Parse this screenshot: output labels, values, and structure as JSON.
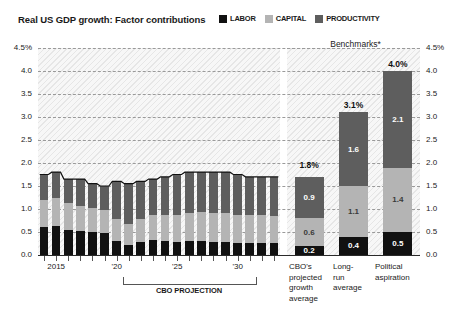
{
  "header": {
    "title": "Real US GDP growth: Factor contributions"
  },
  "legend": {
    "position": "top-right",
    "items": [
      {
        "label": "LABOR",
        "color": "#111111",
        "icon": "square-swatch-icon"
      },
      {
        "label": "CAPITAL",
        "color": "#b4b4b4",
        "icon": "square-swatch-icon"
      },
      {
        "label": "PRODUCTIVITY",
        "color": "#5e5e5e",
        "icon": "square-swatch-icon"
      }
    ]
  },
  "benchmarks_header": "Benchmarks*",
  "projection_bracket_label": "CBO PROJECTION",
  "axis": {
    "y_ticks": [
      "4.5%",
      "4.0",
      "3.5",
      "3.0",
      "2.5",
      "2.0",
      "1.5",
      "1.0",
      "0.5",
      "0.0"
    ],
    "y_ticks_right": [
      "4.5%",
      "4.0",
      "3.5",
      "3.0",
      "2.5",
      "2.0",
      "1.5",
      "1.0",
      "0.5",
      "0.0"
    ],
    "x_labels": [
      "2015",
      "'20",
      "'25",
      "'30"
    ]
  },
  "chart_data": {
    "type": "bar",
    "title": "Real US GDP growth: Factor contributions",
    "subtitle": "",
    "xlabel": "",
    "ylabel": "",
    "ylim": [
      0,
      4.5
    ],
    "grid": true,
    "stacked": true,
    "legend_position": "top-right",
    "annotations": [
      "Benchmarks*",
      "CBO PROJECTION"
    ],
    "series": [
      {
        "name": "LABOR",
        "color": "#111111",
        "values": [
          0.6,
          0.62,
          0.55,
          0.52,
          0.5,
          0.48,
          0.3,
          0.22,
          0.28,
          0.32,
          0.3,
          0.28,
          0.3,
          0.3,
          0.28,
          0.28,
          0.26,
          0.26,
          0.26,
          0.26
        ]
      },
      {
        "name": "CAPITAL",
        "color": "#b4b4b4",
        "values": [
          0.6,
          0.62,
          0.58,
          0.55,
          0.52,
          0.5,
          0.48,
          0.45,
          0.5,
          0.55,
          0.58,
          0.6,
          0.62,
          0.64,
          0.64,
          0.64,
          0.62,
          0.62,
          0.6,
          0.58
        ]
      },
      {
        "name": "PRODUCTIVITY",
        "color": "#5e5e5e",
        "values": [
          0.55,
          0.56,
          0.52,
          0.58,
          0.53,
          0.52,
          0.82,
          0.88,
          0.82,
          0.78,
          0.82,
          0.87,
          0.88,
          0.86,
          0.88,
          0.88,
          0.87,
          0.82,
          0.84,
          0.86
        ]
      }
    ],
    "x": [
      2014,
      2015,
      2016,
      2017,
      2018,
      2019,
      2020,
      2021,
      2022,
      2023,
      2024,
      2025,
      2026,
      2027,
      2028,
      2029,
      2030,
      2031,
      2032,
      2033
    ],
    "projection_starts_at": 2023,
    "benchmarks": [
      {
        "label_lines": [
          "CBO's",
          "projected",
          "growth",
          "average"
        ],
        "total": "1.8%",
        "total_value": 1.8,
        "segments": [
          {
            "name": "LABOR",
            "label": "0.2",
            "value": 0.2
          },
          {
            "name": "CAPITAL",
            "label": "0.6",
            "value": 0.6
          },
          {
            "name": "PRODUCTIVITY",
            "label": "0.9",
            "value": 0.9
          }
        ]
      },
      {
        "label_lines": [
          "Long-",
          "run",
          "average"
        ],
        "total": "3.1%",
        "total_value": 3.1,
        "segments": [
          {
            "name": "LABOR",
            "label": "0.4",
            "value": 0.4
          },
          {
            "name": "CAPITAL",
            "label": "1.1",
            "value": 1.1
          },
          {
            "name": "PRODUCTIVITY",
            "label": "1.6",
            "value": 1.6
          }
        ]
      },
      {
        "label_lines": [
          "Political",
          "aspiration"
        ],
        "total": "4.0%",
        "total_value": 4.0,
        "segments": [
          {
            "name": "LABOR",
            "label": "0.5",
            "value": 0.5
          },
          {
            "name": "CAPITAL",
            "label": "1.4",
            "value": 1.4
          },
          {
            "name": "PRODUCTIVITY",
            "label": "2.1",
            "value": 2.1
          }
        ]
      }
    ]
  }
}
